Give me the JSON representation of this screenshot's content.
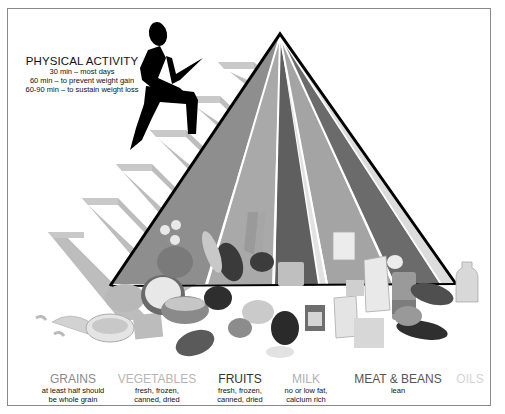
{
  "physical_activity": {
    "title": "PHYSICAL ACTIVITY",
    "lines": [
      "30 min – most days",
      "60 min – to prevent weight gain",
      "60-90 min – to sustain weight loss"
    ]
  },
  "pyramid": {
    "apex": [
      280,
      36
    ],
    "base_y": 283,
    "bands": [
      {
        "name": "grains",
        "color": "#8e8e8e"
      },
      {
        "name": "vegetables",
        "color": "#a9a9a9"
      },
      {
        "name": "fruits",
        "color": "#5f5f5f"
      },
      {
        "name": "oils",
        "color": "#e2e2e2"
      },
      {
        "name": "milk",
        "color": "#a4a4a4"
      },
      {
        "name": "meat-beans",
        "color": "#6b6b6b"
      }
    ],
    "stairs_color": "#bdbdbd",
    "figure_color": "#000000"
  },
  "food_groups": [
    {
      "name": "GRAINS",
      "desc": [
        "at least half should",
        "be whole grain"
      ],
      "color": "#8a8a8a"
    },
    {
      "name": "VEGETABLES",
      "desc": [
        "fresh, frozen,",
        "canned, dried"
      ],
      "color": "#b5b5b5"
    },
    {
      "name": "FRUITS",
      "desc": [
        "fresh, frozen,",
        "canned, dried"
      ],
      "color": "#333333"
    },
    {
      "name": "MILK",
      "desc": [
        "no or low fat,",
        "calcium rich"
      ],
      "color": "#b0b0b0"
    },
    {
      "name": "MEAT & BEANS",
      "desc": [
        "lean"
      ],
      "color": "#555555"
    },
    {
      "name": "OILS",
      "desc": [],
      "color": "#d4d4d4"
    }
  ]
}
